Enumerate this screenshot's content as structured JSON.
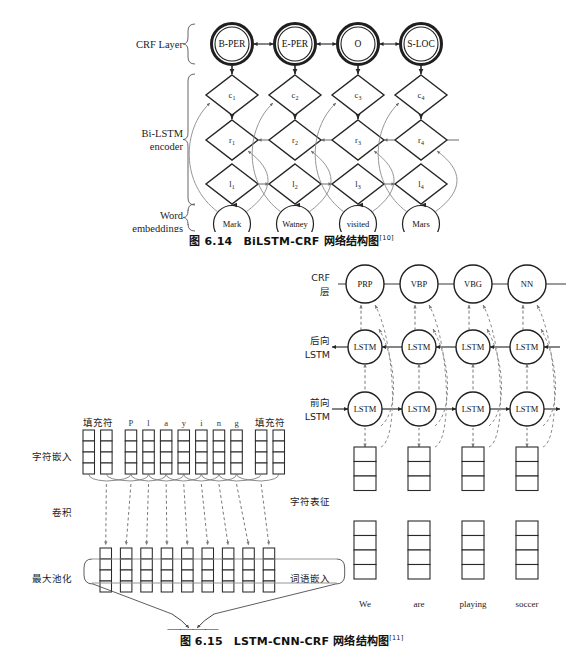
{
  "figure1": {
    "caption_prefix": "图 6.14",
    "caption_title": "BiLSTM-CRF 网络结构图",
    "caption_ref": "[10]",
    "row_labels": {
      "crf": "CRF Layer",
      "encoder_line1": "Bi-LSTM",
      "encoder_line2": "encoder",
      "embed_line1": "Word",
      "embed_line2": "embeddings"
    },
    "crf_nodes": [
      "B-PER",
      "E-PER",
      "O",
      "S-LOC"
    ],
    "c_nodes": [
      "c",
      "c",
      "c",
      "c"
    ],
    "c_subs": [
      "1",
      "2",
      "3",
      "4"
    ],
    "r_nodes": [
      "r",
      "r",
      "r",
      "r"
    ],
    "r_subs": [
      "1",
      "2",
      "3",
      "4"
    ],
    "l_nodes": [
      "l",
      "l",
      "l",
      "l"
    ],
    "l_subs": [
      "1",
      "2",
      "3",
      "4"
    ],
    "words": [
      "Mark",
      "Watney",
      "visited",
      "Mars"
    ]
  },
  "figure2": {
    "caption_prefix": "图 6.15",
    "caption_title": "LSTM-CNN-CRF 网络结构图",
    "caption_ref": "[11]",
    "left_panel": {
      "row_labels": {
        "char_embed": "字符嵌入",
        "conv": "卷积",
        "maxpool": "最大池化",
        "char_rep": "字符表征"
      },
      "top_tokens": [
        "填充符",
        "P",
        "l",
        "a",
        "y",
        "i",
        "n",
        "g",
        "填充符"
      ],
      "char_embed_columns": 11,
      "char_embed_cells": 4,
      "conv_columns": 9,
      "conv_cells": 4,
      "char_rep_cells": 4
    },
    "right_panel": {
      "row_labels": {
        "crf_line1": "CRF",
        "crf_line2": "层",
        "back_line1": "后向",
        "back_line2": "LSTM",
        "fwd_line1": "前向",
        "fwd_line2": "LSTM",
        "char_rep": "字符表征",
        "word_embed": "词语嵌入"
      },
      "crf_nodes": [
        "PRP",
        "VBP",
        "VBG",
        "NN"
      ],
      "backward_nodes": [
        "LSTM",
        "LSTM",
        "LSTM",
        "LSTM"
      ],
      "forward_nodes": [
        "LSTM",
        "LSTM",
        "LSTM",
        "LSTM"
      ],
      "char_rep_cells": 3,
      "word_embed_cells": 4,
      "words": [
        "We",
        "are",
        "playing",
        "soccer"
      ]
    }
  },
  "colors": {
    "ink": "#1a1a1a",
    "line": "#3a3a3a",
    "thin": "#6d6d6d",
    "dashed": "#7a7a7a"
  }
}
